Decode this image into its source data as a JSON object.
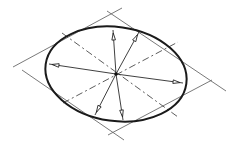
{
  "figure": {
    "type": "isometric-ellipse-construction",
    "colors": {
      "ellipse": "#1a1a1a",
      "construction_lines": "#6a6a6a",
      "dashed_axes": "#4a4a4a",
      "background": "#ffffff"
    },
    "center": [
      116,
      74
    ],
    "ellipse": {
      "cx": 116,
      "cy": 74,
      "rx": 71,
      "ry": 47,
      "rotate": 8
    },
    "rhombus_lines": [
      {
        "x1": 13,
        "y1": 67,
        "x2": 122,
        "y2": 8
      },
      {
        "x1": 107,
        "y1": 11,
        "x2": 226,
        "y2": 91
      },
      {
        "x1": 22,
        "y1": 70,
        "x2": 124,
        "y2": 140
      },
      {
        "x1": 108,
        "y1": 135,
        "x2": 212,
        "y2": 80
      }
    ],
    "dashed_axes": [
      {
        "x1": 62,
        "y1": 33,
        "x2": 178,
        "y2": 117
      },
      {
        "x1": 63,
        "y1": 103,
        "x2": 178,
        "y2": 42
      }
    ],
    "radius_arrows": [
      {
        "name": "top",
        "x2": 113,
        "y2": 30
      },
      {
        "name": "top-right",
        "x2": 139,
        "y2": 32
      },
      {
        "name": "left",
        "x2": 49,
        "y2": 64
      },
      {
        "name": "right",
        "x2": 183,
        "y2": 83
      },
      {
        "name": "bottom-left",
        "x2": 95,
        "y2": 115
      },
      {
        "name": "bottom",
        "x2": 123,
        "y2": 120
      }
    ]
  }
}
